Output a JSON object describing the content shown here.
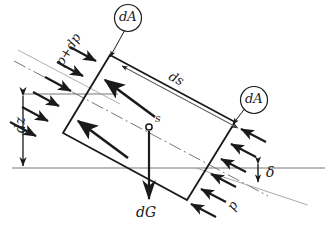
{
  "figure": {
    "background_color": "#ffffff",
    "line_color": "#1a1a1a",
    "thin_line_color": "#666666"
  },
  "labels": {
    "area_top": "dA",
    "area_right": "dA",
    "length_ds": "ds",
    "height_dz": "dz",
    "pressure_high": "p+dp",
    "pressure_low": "p",
    "weight": "dG",
    "centroid": "s",
    "angle": "δ"
  },
  "geometry": {
    "element_corners": {
      "top_left": [
        110,
        55
      ],
      "top_right": [
        235,
        122
      ],
      "bottom_right": [
        187,
        200
      ],
      "bottom_left": [
        63,
        133
      ]
    },
    "centroid_point": [
      149,
      127
    ],
    "datum_line_y": 168,
    "upper_reference_line_y": 94,
    "dz_dimension_x": 23,
    "incline_angle_deg": 28,
    "pressure_arrows_left": 6,
    "pressure_arrows_right": 6,
    "interior_force_arrows": 2
  },
  "annotations": {
    "description": "Rectangular fluid element of cross-section dA and length ds inclined at angle delta, with pressure p on the lower face, pressure p+dp on the upper face, weight dG acting downward at centroid s, and vertical height difference dz."
  }
}
